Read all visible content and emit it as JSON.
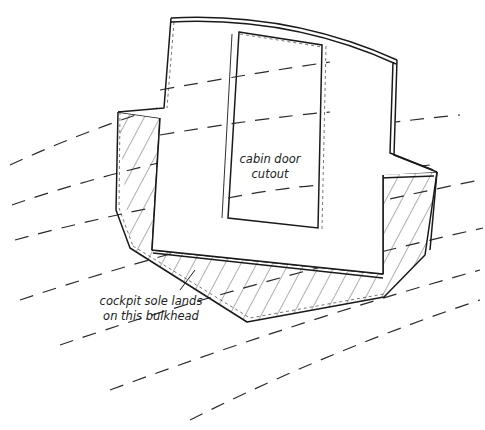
{
  "diagram": {
    "type": "technical-illustration",
    "labels": {
      "door_cutout_line1": "cabin door",
      "door_cutout_line2": "cutout",
      "cockpit_line1": "cockpit sole lands",
      "cockpit_line2": "on this bulkhead"
    },
    "colors": {
      "line": "#1a1a1a",
      "hatch": "#333333",
      "dash": "#2a2a2a",
      "background": "#ffffff"
    }
  }
}
